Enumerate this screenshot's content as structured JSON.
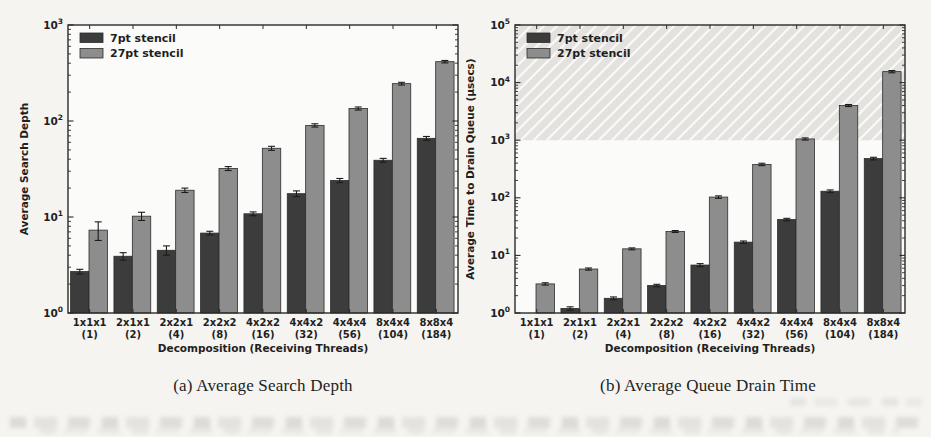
{
  "page": {
    "background": "#f5f4f1"
  },
  "colors": {
    "bar_7pt": "#3c3c3c",
    "bar_27pt": "#8d8d8d",
    "bar_edge": "#2c2c2c",
    "error_bar": "#1c1c1c",
    "axis": "#2b2b2b",
    "text": "#1f1f1f",
    "plot_bg": "#fbfbf9",
    "shade_fill": "#e3e2de",
    "shade_hatch": "#ffffff"
  },
  "legend": {
    "items": [
      {
        "label": "7pt stencil",
        "color_key": "bar_7pt"
      },
      {
        "label": "27pt stencil",
        "color_key": "bar_27pt"
      }
    ],
    "position": "upper left"
  },
  "chart_data": [
    {
      "type": "bar",
      "title": "(a) Average Search Depth",
      "ylabel": "Average Search Depth",
      "xlabel": "Decomposition (Receiving Threads)",
      "yscale": "log",
      "ylim": [
        1,
        1000
      ],
      "grid": false,
      "legend_position": "upper left",
      "categories": [
        "1x1x1",
        "2x1x1",
        "2x2x1",
        "2x2x2",
        "4x2x2",
        "4x4x2",
        "4x4x4",
        "8x4x4",
        "8x8x4"
      ],
      "category_sublabels": [
        "(1)",
        "(2)",
        "(4)",
        "(8)",
        "(16)",
        "(32)",
        "(56)",
        "(104)",
        "(184)"
      ],
      "series": [
        {
          "name": "7pt stencil",
          "values": [
            2.7,
            3.9,
            4.5,
            6.8,
            10.8,
            17.5,
            24,
            39,
            66
          ],
          "errors": [
            0.15,
            0.35,
            0.5,
            0.3,
            0.5,
            1.2,
            1.2,
            1.8,
            3
          ]
        },
        {
          "name": "27pt stencil",
          "values": [
            7.3,
            10.2,
            19,
            32,
            52,
            90,
            135,
            245,
            415
          ],
          "errors": [
            1.6,
            1.0,
            1.0,
            1.5,
            2.5,
            3.5,
            5,
            8,
            12
          ]
        }
      ]
    },
    {
      "type": "bar",
      "title": "(b) Average Queue Drain Time",
      "ylabel": "Average Time to Drain Queue (µsecs)",
      "xlabel": "Decomposition (Receiving Threads)",
      "yscale": "log",
      "ylim": [
        1,
        100000
      ],
      "grid": false,
      "legend_position": "upper left",
      "shaded_band": {
        "from": 1000,
        "to": 100000,
        "style": "hatched"
      },
      "categories": [
        "1x1x1",
        "2x1x1",
        "2x2x1",
        "2x2x2",
        "4x2x2",
        "4x4x2",
        "4x4x4",
        "8x4x4",
        "8x8x4"
      ],
      "category_sublabels": [
        "(1)",
        "(2)",
        "(4)",
        "(8)",
        "(16)",
        "(32)",
        "(56)",
        "(104)",
        "(184)"
      ],
      "series": [
        {
          "name": "7pt stencil",
          "values": [
            1.0,
            1.2,
            1.8,
            3.0,
            6.8,
            17,
            42,
            130,
            480
          ],
          "errors": [
            0,
            0.08,
            0.1,
            0.15,
            0.4,
            0.8,
            2,
            7,
            25
          ]
        },
        {
          "name": "27pt stencil",
          "values": [
            3.2,
            5.8,
            13,
            26,
            103,
            380,
            1050,
            4000,
            15500
          ],
          "errors": [
            0.15,
            0.25,
            0.5,
            1,
            5,
            18,
            45,
            160,
            700
          ]
        }
      ]
    }
  ]
}
